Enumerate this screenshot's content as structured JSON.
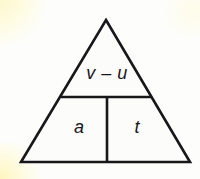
{
  "figure": {
    "type": "formula-triangle-diagram",
    "background_color": "#fdfdfb",
    "fill_color": "#fcfcfa",
    "stroke_color": "#17171a",
    "stroke_width_px": 2.6,
    "geometry": {
      "apex": [
        106,
        20
      ],
      "bottom_left": [
        21,
        162
      ],
      "bottom_right": [
        190,
        162
      ],
      "horizontal_divider_y": 97,
      "horizontal_divider_x_start": 62,
      "horizontal_divider_x_end": 151,
      "vertical_divider_x": 107,
      "vertical_divider_y_start": 97,
      "vertical_divider_y_end": 162
    },
    "cells": {
      "top": {
        "label": "v – u",
        "role": "numerator"
      },
      "bottom_left": {
        "label": "a",
        "role": "denominator-left"
      },
      "bottom_right": {
        "label": "t",
        "role": "denominator-right"
      }
    }
  }
}
